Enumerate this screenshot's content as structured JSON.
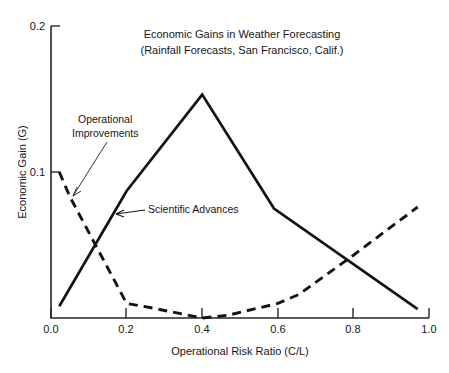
{
  "chart_data": {
    "type": "line",
    "title": "Economic Gains in Weather Forecasting",
    "subtitle": "(Rainfall Forecasts, San Francisco, Calif.)",
    "xlabel": "Operational Risk Ratio (C/L)",
    "ylabel": "Economic Gain (G)",
    "xlim": [
      0.0,
      1.0
    ],
    "ylim": [
      0.0,
      0.2
    ],
    "xticks": [
      0.0,
      0.2,
      0.4,
      0.6,
      0.8,
      1.0
    ],
    "xtick_labels": [
      "0.0",
      "0.2",
      "0.4",
      "0.6",
      "0.8",
      "1.0"
    ],
    "yticks": [
      0.1,
      0.2
    ],
    "ytick_labels": [
      "0.1",
      "0.2"
    ],
    "grid": false,
    "legend_position": "inline-annotations",
    "series": [
      {
        "name": "Scientific Advances",
        "style": "solid",
        "color": "#131313",
        "x": [
          0.022,
          0.2,
          0.4,
          0.59,
          0.97
        ],
        "values": [
          0.008,
          0.087,
          0.153,
          0.075,
          0.006
        ]
      },
      {
        "name": "Operational Improvements",
        "style": "dashed",
        "color": "#131313",
        "x": [
          0.022,
          0.05,
          0.2,
          0.265,
          0.4,
          0.47,
          0.6,
          0.655,
          0.8,
          0.97
        ],
        "values": [
          0.1,
          0.083,
          0.01,
          0.007,
          0.0,
          0.002,
          0.01,
          0.016,
          0.043,
          0.076
        ]
      }
    ],
    "annotations": [
      {
        "label": "Operational Improvements",
        "target_series": "Operational Improvements",
        "target_x": 0.05,
        "target_y": 0.083,
        "arrow": false
      },
      {
        "label": "Scientific Advances",
        "target_series": "Scientific Advances",
        "target_x": 0.155,
        "target_y": 0.069,
        "arrow": true
      }
    ]
  },
  "annotation_text": {
    "operational_line1": "Operational",
    "operational_line2": "Improvements",
    "scientific": "Scientific Advances"
  }
}
